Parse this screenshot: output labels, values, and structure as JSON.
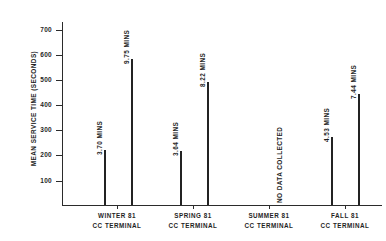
{
  "chart_data": {
    "type": "bar",
    "title": "",
    "subtitle": "",
    "xlabel": "",
    "ylabel": "MEAN SERVICE TIME (SECONDS)",
    "ylim": [
      0,
      750
    ],
    "yticks": [
      100,
      200,
      300,
      400,
      500,
      600,
      700
    ],
    "ytick_labels": [
      "100",
      "200",
      "300",
      "400",
      "500",
      "600",
      "700"
    ],
    "grid": false,
    "legend": "none",
    "units_note": "Bar value labels are given in minutes; axis is in seconds.",
    "categories": [
      "WINTER 81 CC TERMINAL",
      "SPRING 81 CC TERMINAL",
      "SUMMER 81 CC TERMINAL",
      "FALL 81 CC TERMINAL"
    ],
    "category_lines": [
      [
        "WINTER 81",
        "CC TERMINAL"
      ],
      [
        "SPRING 81",
        "CC TERMINAL"
      ],
      [
        "SUMMER 81",
        "CC TERMINAL"
      ],
      [
        "FALL 81",
        "CC TERMINAL"
      ]
    ],
    "series": [
      {
        "name": "first bar",
        "values_minutes": [
          3.7,
          3.64,
          null,
          4.53
        ],
        "values_seconds": [
          222,
          218,
          null,
          272
        ],
        "labels": [
          "3.70 MINS",
          "3.64 MINS",
          null,
          "4.53 MINS"
        ]
      },
      {
        "name": "second bar",
        "values_minutes": [
          9.75,
          8.22,
          null,
          7.44
        ],
        "values_seconds": [
          585,
          493,
          null,
          446
        ],
        "labels": [
          "9.75 MINS",
          "8.22 MINS",
          null,
          "7.44 MINS"
        ]
      }
    ],
    "annotations": [
      {
        "category": "SUMMER 81 CC TERMINAL",
        "text": "NO DATA COLLECTED"
      }
    ],
    "colors": {
      "bar": "#232323",
      "axis": "#2b2b2b",
      "text": "#1f1f1f",
      "background": "#ffffff"
    }
  },
  "bars": [
    {
      "label": "3.70 MINS",
      "x": 104,
      "top": 150,
      "height": 55
    },
    {
      "label": "9.75 MINS",
      "x": 131,
      "top": 59,
      "height": 146
    },
    {
      "label": "3.64 MINS",
      "x": 180,
      "top": 151,
      "height": 54
    },
    {
      "label": "8.22 MINS",
      "x": 207,
      "top": 82,
      "height": 123
    },
    {
      "label": "4.53 MINS",
      "x": 331,
      "top": 137,
      "height": 68
    },
    {
      "label": "7.44 MINS",
      "x": 358,
      "top": 94,
      "height": 111
    }
  ],
  "no_data": {
    "label": "NO DATA COLLECTED",
    "x": 283,
    "bottom_y": 196
  },
  "yticks": [
    {
      "label": "700",
      "y": 30
    },
    {
      "label": "600",
      "y": 55
    },
    {
      "label": "500",
      "y": 80
    },
    {
      "label": "400",
      "y": 105
    },
    {
      "label": "300",
      "y": 130
    },
    {
      "label": "200",
      "y": 155
    },
    {
      "label": "100",
      "y": 181
    }
  ],
  "xticks": [
    117,
    193,
    269,
    345
  ],
  "categories": [
    {
      "line1": "WINTER 81",
      "line2": "CC TERMINAL",
      "x": 71
    },
    {
      "line1": "SPRING 81",
      "line2": "CC TERMINAL",
      "x": 147
    },
    {
      "line1": "SUMMER 81",
      "line2": "CC TERMINAL",
      "x": 223
    },
    {
      "line1": "FALL 81",
      "line2": "CC TERMINAL",
      "x": 299
    }
  ],
  "axis_title": {
    "text": "MEAN SERVICE TIME (SECONDS)"
  }
}
